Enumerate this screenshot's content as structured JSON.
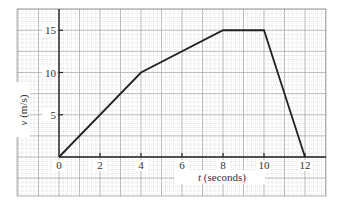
{
  "chart_data": {
    "type": "line",
    "title": "",
    "xlabel": "t (seconds)",
    "xlabel_var": "t",
    "xlabel_unit": "(seconds)",
    "ylabel": "v (m/s)",
    "ylabel_var": "v",
    "ylabel_unit": "(m/s)",
    "x": [
      0,
      4,
      8,
      10,
      12
    ],
    "series": [
      {
        "name": "velocity",
        "values": [
          0,
          10,
          15,
          15,
          0
        ]
      }
    ],
    "xlim": [
      -2,
      13
    ],
    "ylim": [
      -4.5,
      17.5
    ],
    "xticks": [
      0,
      2,
      4,
      6,
      8,
      10,
      12
    ],
    "xtick_labels": [
      "0",
      "2",
      "4",
      "6",
      "8",
      "10",
      "12"
    ],
    "yticks": [
      5,
      10,
      15
    ],
    "ytick_labels": [
      "5",
      "10",
      "15"
    ],
    "grid": true,
    "legend": null
  },
  "colors": {
    "line": "#222222",
    "axis": "#222222",
    "grid_major": "#9a9a9a",
    "grid_minor": "#c8c8c8",
    "background": "#ffffff"
  }
}
